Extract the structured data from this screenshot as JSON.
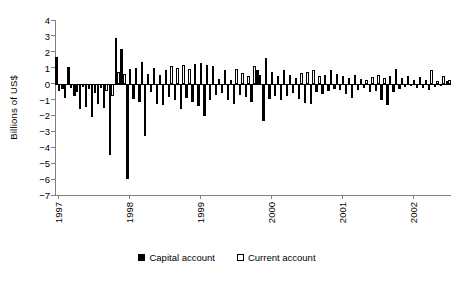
{
  "chart_data": {
    "type": "bar",
    "title": "",
    "subtitle": "",
    "xlabel": "",
    "ylabel": "Billions of US$",
    "ylim": [
      -7,
      4
    ],
    "yticks": [
      4,
      3,
      2,
      1,
      0,
      -1,
      -2,
      -3,
      -4,
      -5,
      -6,
      -7
    ],
    "ytick_labels": [
      "4",
      "3",
      "2",
      "1",
      "0",
      "−1",
      "−2",
      "−3",
      "−4",
      "−5",
      "−6",
      "−7"
    ],
    "grid": false,
    "legend_position": "bottom-center",
    "x_tick_labels": [
      "1997",
      "1998",
      "1999",
      "2000",
      "2001",
      "2002"
    ],
    "x_tick_index": [
      0,
      12,
      24,
      36,
      48,
      60
    ],
    "categories": [
      "1997-01",
      "1997-02",
      "1997-03",
      "1997-04",
      "1997-05",
      "1997-06",
      "1997-07",
      "1997-08",
      "1997-09",
      "1997-10",
      "1997-11",
      "1997-12",
      "1998-01",
      "1998-02",
      "1998-03",
      "1998-04",
      "1998-05",
      "1998-06",
      "1998-07",
      "1998-08",
      "1998-09",
      "1998-10",
      "1998-11",
      "1998-12",
      "1999-01",
      "1999-02",
      "1999-03",
      "1999-04",
      "1999-05",
      "1999-06",
      "1999-07",
      "1999-08",
      "1999-09",
      "1999-10",
      "1999-11",
      "1999-12",
      "2000-01",
      "2000-02",
      "2000-03",
      "2000-04",
      "2000-05",
      "2000-06",
      "2000-07",
      "2000-08",
      "2000-09",
      "2000-10",
      "2000-11",
      "2000-12",
      "2001-01",
      "2001-02",
      "2001-03",
      "2001-04",
      "2001-05",
      "2001-06",
      "2001-07",
      "2001-08",
      "2001-09",
      "2001-10",
      "2001-11",
      "2001-12",
      "2002-01",
      "2002-02",
      "2002-03",
      "2002-04",
      "2002-05",
      "2002-06",
      "2002-07"
    ],
    "series": [
      {
        "name": "Capital account",
        "color": "#000000",
        "fill": "solid",
        "values": [
          1.65,
          -0.35,
          1.05,
          -0.75,
          -1.6,
          -1.45,
          -2.1,
          -1.3,
          -1.55,
          -4.5,
          2.9,
          2.2,
          -6.0,
          -0.95,
          -1.15,
          -3.3,
          -0.5,
          -1.25,
          -1.35,
          -0.85,
          -1.0,
          -1.6,
          -0.9,
          -1.15,
          -1.4,
          -2.05,
          -1.05,
          -0.7,
          -0.6,
          -1.0,
          -1.3,
          -0.7,
          -0.85,
          -1.15,
          0.85,
          -2.35,
          -0.95,
          -0.75,
          -1.05,
          -0.8,
          -0.6,
          -0.95,
          -1.2,
          -1.3,
          -0.55,
          -0.65,
          -0.45,
          -0.35,
          -0.4,
          -0.65,
          -0.9,
          -0.4,
          -0.3,
          -0.55,
          -0.45,
          -1.0,
          -1.35,
          -0.5,
          -0.35,
          -0.2,
          -0.15,
          -0.3,
          -0.25,
          -0.4,
          -0.2,
          -0.15,
          0.15
        ]
      },
      {
        "name": "Current account",
        "color": "#ffffff",
        "fill": "open",
        "values": [
          -0.45,
          -0.9,
          -0.25,
          -0.55,
          -0.2,
          -0.35,
          -0.6,
          -0.3,
          -0.45,
          -0.75,
          0.75,
          0.6,
          0.95,
          1.0,
          1.35,
          0.6,
          1.0,
          0.55,
          0.85,
          1.1,
          1.0,
          1.15,
          0.95,
          1.25,
          1.3,
          1.2,
          1.1,
          0.3,
          0.85,
          0.2,
          0.95,
          0.65,
          0.45,
          1.1,
          0.55,
          1.6,
          0.75,
          0.45,
          0.85,
          0.55,
          0.35,
          0.65,
          0.75,
          0.85,
          0.45,
          0.55,
          0.85,
          0.6,
          0.5,
          0.35,
          0.55,
          0.3,
          0.25,
          0.4,
          0.55,
          0.35,
          0.45,
          0.9,
          0.35,
          0.5,
          0.25,
          0.4,
          0.2,
          0.85,
          0.15,
          0.45,
          0.2
        ]
      }
    ]
  },
  "legend": {
    "items": [
      {
        "label": "Capital account",
        "swatch": "filled-square-icon"
      },
      {
        "label": "Current account",
        "swatch": "open-square-icon"
      }
    ]
  }
}
